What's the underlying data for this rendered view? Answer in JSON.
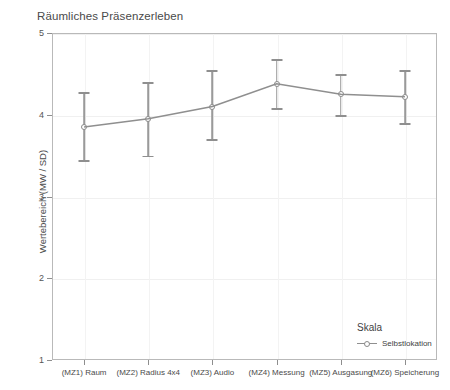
{
  "chart_data": {
    "type": "line",
    "title": "Räumliches Präsenzerleben",
    "xlabel": "",
    "ylabel": "Wertebereich (MW / SD)",
    "ylim": [
      1,
      5
    ],
    "yticks": [
      1,
      2,
      3,
      4,
      5
    ],
    "ytick_labels": [
      "1",
      "2",
      "3",
      "4",
      "5"
    ],
    "grid": true,
    "legend_position": "bottom-right",
    "legend_title": "Skala",
    "categories": [
      "(MZ1) Raum",
      "(MZ2) Radius 4x4",
      "(MZ3) Audio",
      "(MZ4) Messung",
      "(MZ5) Ausgasung",
      "(MZ6) Speicherung"
    ],
    "series": [
      {
        "name": "Selbstlokation",
        "values": [
          3.85,
          3.95,
          4.1,
          4.38,
          4.25,
          4.22
        ],
        "error_low": [
          3.45,
          3.5,
          3.7,
          4.08,
          4.0,
          3.9
        ],
        "error_high": [
          4.28,
          4.4,
          4.55,
          4.68,
          4.5,
          4.55
        ],
        "marker": "open-circle",
        "color": "#8f8f8f"
      }
    ]
  },
  "axis": {
    "y_title": "Wertebereich (MW / SD)"
  },
  "legend": {
    "title": "Skala",
    "entries": [
      {
        "label": "Selbstlokation"
      }
    ]
  }
}
